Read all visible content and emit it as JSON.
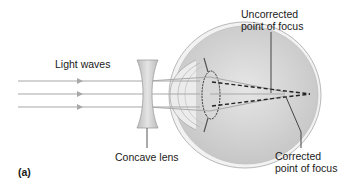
{
  "figure": {
    "panel_label": "(a)",
    "labels": {
      "light_waves": "Light waves",
      "concave_lens": "Concave lens",
      "uncorrected_line1": "Uncorrected",
      "uncorrected_line2": "point of focus",
      "corrected_line1": "Corrected",
      "corrected_line2": "point of focus"
    },
    "rays": {
      "count": 3,
      "y_positions": [
        81,
        94,
        107
      ]
    },
    "colors": {
      "ray": "#a8a8a8",
      "lens_fill": "#c8c8c8",
      "eye_fill": "#d4d4d4",
      "eye_outline": "#b0b0b0",
      "dashed_ray": "#222222",
      "leader_line": "#444444",
      "text": "#1a1a1a"
    }
  }
}
